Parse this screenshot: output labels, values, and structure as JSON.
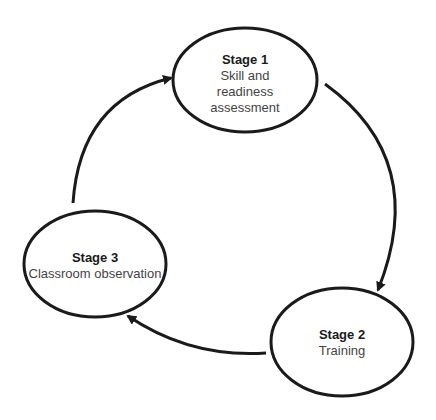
{
  "diagram": {
    "type": "cycle",
    "stages": [
      {
        "id": "stage1",
        "title": "Stage 1",
        "description_lines": [
          "Skill and",
          "readiness",
          "assessment"
        ]
      },
      {
        "id": "stage2",
        "title": "Stage 2",
        "description_lines": [
          "Training"
        ]
      },
      {
        "id": "stage3",
        "title": "Stage 3",
        "description_lines": [
          "Classroom observation"
        ]
      }
    ],
    "edges": [
      {
        "from": "stage1",
        "to": "stage2"
      },
      {
        "from": "stage2",
        "to": "stage3"
      },
      {
        "from": "stage3",
        "to": "stage1"
      }
    ],
    "colors": {
      "stroke": "#1a1a1a",
      "background": "#ffffff"
    }
  }
}
